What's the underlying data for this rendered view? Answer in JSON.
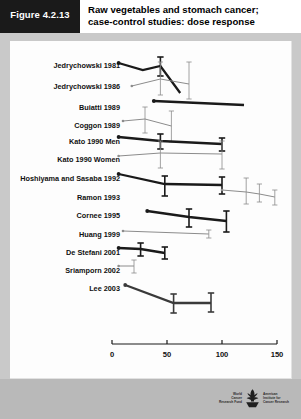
{
  "header": {
    "figure_tag": "Figure 4.2.13",
    "title_line1": "Raw vegetables and stomach cancer;",
    "title_line2": "case-control studies: dose response"
  },
  "footer": {
    "logo_left_line1": "World",
    "logo_left_line2": "Cancer",
    "logo_left_line3": "Research Fund",
    "logo_right_line1": "American",
    "logo_right_line2": "Institute for",
    "logo_right_line3": "Cancer Research",
    "logo_mark_name": "wcrf-aicr-globe-logo"
  },
  "chart_data": {
    "type": "line",
    "title": "Raw vegetables and stomach cancer; case-control studies: dose response",
    "xlabel": "Raw vegetables (g/day)",
    "ylabel": "",
    "xlim": [
      0,
      150
    ],
    "xticks": [
      0,
      50,
      100,
      150
    ],
    "xtick_labels": [
      "0",
      "50",
      "100",
      "150"
    ],
    "grid": false,
    "legend": "none",
    "note": "Each study is plotted on its own horizontal baseline; y position encodes study, not value. Series are relative-risk trend lines with 95% confidence interval whiskers.",
    "series": [
      {
        "name": "Jedrychowski 1981",
        "row": 0,
        "color": "#1a1a1a",
        "weight": "thick",
        "points": [
          {
            "x": 6,
            "y_px": 63,
            "marker": "dot"
          },
          {
            "x": 28,
            "y_px": 70,
            "ci_px": null
          },
          {
            "x": 44,
            "y_px": 66,
            "ci_px": [
              57,
              76
            ]
          },
          {
            "x": 62,
            "y_px": 93,
            "ci_px": null
          }
        ]
      },
      {
        "name": "Jedrychowski 1986",
        "row": 1,
        "color": "#8c8c8c",
        "weight": "thin",
        "points": [
          {
            "x": 18,
            "y_px": 86,
            "marker": "dot"
          },
          {
            "x": 44,
            "y_px": 79,
            "ci_px": [
              62,
              95
            ]
          },
          {
            "x": 70,
            "y_px": 84,
            "ci_px": [
              62,
              99
            ]
          }
        ]
      },
      {
        "name": "Buiatti 1989",
        "row": 2,
        "color": "#1a1a1a",
        "weight": "thick",
        "points": [
          {
            "x": 38,
            "y_px": 101,
            "marker": "dot"
          },
          {
            "x": 120,
            "y_px": 105,
            "ci_px": null
          }
        ]
      },
      {
        "name": "Coggon 1989",
        "row": 3,
        "color": "#8c8c8c",
        "weight": "thin",
        "points": [
          {
            "x": 10,
            "y_px": 121,
            "marker": "dot"
          },
          {
            "x": 30,
            "y_px": 119,
            "ci_px": [
              107,
              133
            ]
          },
          {
            "x": 54,
            "y_px": 126,
            "ci_px": [
              111,
              142
            ]
          }
        ]
      },
      {
        "name": "Kato 1990 Men",
        "row": 4,
        "color": "#1a1a1a",
        "weight": "thick",
        "points": [
          {
            "x": 6,
            "y_px": 137,
            "marker": "dot"
          },
          {
            "x": 44,
            "y_px": 141,
            "ci_px": [
              134,
              149
            ]
          },
          {
            "x": 100,
            "y_px": 144,
            "ci_px": [
              138,
              151
            ]
          }
        ]
      },
      {
        "name": "Kato 1990 Women",
        "row": 5,
        "color": "#8c8c8c",
        "weight": "thin",
        "points": [
          {
            "x": 6,
            "y_px": 156,
            "marker": "dot"
          },
          {
            "x": 44,
            "y_px": 153,
            "ci_px": [
              141,
              168
            ]
          },
          {
            "x": 100,
            "y_px": 154,
            "ci_px": [
              141,
              169
            ]
          }
        ]
      },
      {
        "name": "Hoshiyama and Sasaba 1992",
        "row": 6,
        "color": "#1a1a1a",
        "weight": "thick",
        "points": [
          {
            "x": 6,
            "y_px": 174,
            "marker": "dot"
          },
          {
            "x": 48,
            "y_px": 184,
            "ci_px": [
              176,
              196
            ]
          },
          {
            "x": 100,
            "y_px": 185,
            "ci_px": [
              177,
              194
            ]
          }
        ]
      },
      {
        "name": "Ramon 1993",
        "row": 7,
        "color": "#8c8c8c",
        "weight": "thin",
        "points": [
          {
            "x": 100,
            "y_px": 190,
            "marker": "dot"
          },
          {
            "x": 122,
            "y_px": 192,
            "ci_px": [
              178,
              204
            ]
          },
          {
            "x": 134,
            "y_px": 194,
            "ci_px": [
              184,
              202
            ]
          },
          {
            "x": 148,
            "y_px": 197,
            "ci_px": [
              190,
              205
            ]
          }
        ]
      },
      {
        "name": "Cornee 1995",
        "row": 8,
        "color": "#1a1a1a",
        "weight": "thick",
        "points": [
          {
            "x": 32,
            "y_px": 211,
            "marker": "dot"
          },
          {
            "x": 70,
            "y_px": 217,
            "ci_px": [
              209,
              227
            ]
          },
          {
            "x": 104,
            "y_px": 221,
            "ci_px": [
              211,
              232
            ]
          }
        ]
      },
      {
        "name": "Huang 1999",
        "row": 9,
        "color": "#8c8c8c",
        "weight": "thin",
        "points": [
          {
            "x": 10,
            "y_px": 231,
            "marker": "dot"
          },
          {
            "x": 88,
            "y_px": 234,
            "ci_px": [
              230,
              238
            ]
          }
        ]
      },
      {
        "name": "De Stefani 2001",
        "row": 10,
        "color": "#1a1a1a",
        "weight": "thick",
        "points": [
          {
            "x": 6,
            "y_px": 248,
            "marker": "dot"
          },
          {
            "x": 26,
            "y_px": 249,
            "ci_px": [
              243,
              256
            ]
          },
          {
            "x": 48,
            "y_px": 253,
            "ci_px": [
              247,
              259
            ]
          }
        ]
      },
      {
        "name": "Sriamporn 2002",
        "row": 11,
        "color": "#8c8c8c",
        "weight": "thin",
        "points": [
          {
            "x": 6,
            "y_px": 266,
            "marker": "dot"
          },
          {
            "x": 20,
            "y_px": 266,
            "ci_px": [
              260,
              273
            ]
          }
        ]
      },
      {
        "name": "Lee 2003",
        "row": 12,
        "color": "#3a3a3a",
        "weight": "thick",
        "points": [
          {
            "x": 12,
            "y_px": 285,
            "marker": "dot"
          },
          {
            "x": 56,
            "y_px": 303,
            "ci_px": [
              294,
              313
            ]
          },
          {
            "x": 90,
            "y_px": 303,
            "ci_px": [
              293,
              312
            ]
          }
        ]
      }
    ],
    "study_labels": [
      "Jedrychowski 1981",
      "Jedrychowski 1986",
      "Buiatti 1989",
      "Coggon 1989",
      "Kato 1990 Men",
      "Kato 1990 Women",
      "Hoshiyama and Sasaba 1992",
      "Ramon 1993",
      "Cornee 1995",
      "Huang 1999",
      "De Stefani 2001",
      "Sriamporn 2002",
      "Lee 2003"
    ],
    "label_y_px": [
      65,
      86,
      107,
      125,
      141,
      159,
      178,
      197,
      215,
      234,
      252,
      270,
      288
    ]
  }
}
